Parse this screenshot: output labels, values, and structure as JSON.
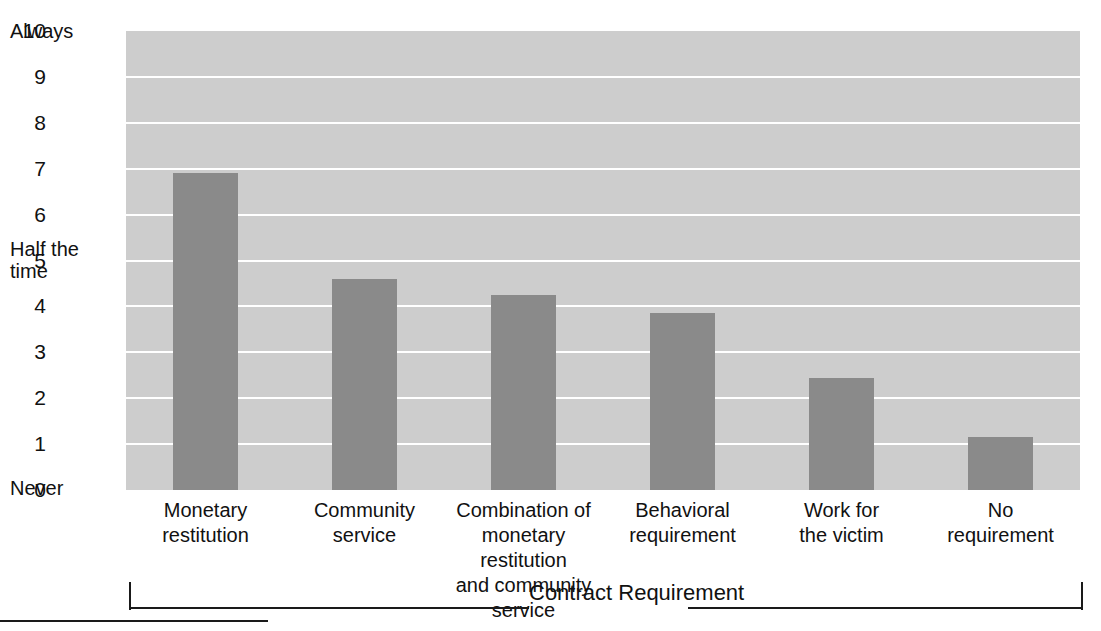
{
  "chart_data": {
    "type": "bar",
    "title": "",
    "subtitle": "",
    "xlabel": "Contract Requirement",
    "ylabel": "",
    "ylim": [
      0,
      10
    ],
    "grid": true,
    "legend": "none",
    "categories": [
      "Monetary\nrestitution",
      "Community\nservice",
      "Combination of\nmonetary restitution\nand community service",
      "Behavioral\nrequirement",
      "Work for\nthe victim",
      "No\nrequirement"
    ],
    "values": [
      6.9,
      4.6,
      4.25,
      3.85,
      2.45,
      1.15
    ],
    "ytick_labels": [
      "10",
      "9",
      "8",
      "7",
      "6",
      "5",
      "4",
      "3",
      "2",
      "1",
      "0"
    ],
    "ytick_values": [
      10,
      9,
      8,
      7,
      6,
      5,
      4,
      3,
      2,
      1,
      0
    ],
    "y_anchor_labels": [
      {
        "text": "Always",
        "value": 10
      },
      {
        "text": "Half the\ntime",
        "value": 5
      },
      {
        "text": "Never",
        "value": 0
      }
    ],
    "colors": {
      "bar": "#8a8a8a",
      "plot_background": "#cdcdcd",
      "gridline": "#ffffff",
      "text": "#111111",
      "axis_rule": "#1a1a1a",
      "page_background": "#ffffff"
    }
  },
  "y_axis": {
    "always_label": "Always",
    "half_label": "Half the\ntime",
    "never_label": "Never",
    "tick_10": "10",
    "tick_9": "9",
    "tick_8": "8",
    "tick_7": "7",
    "tick_6": "6",
    "tick_5": "5",
    "tick_4": "4",
    "tick_3": "3",
    "tick_2": "2",
    "tick_1": "1",
    "tick_0": "0"
  },
  "x_axis": {
    "title": "Contract Requirement",
    "cat_1": "Monetary\nrestitution",
    "cat_2": "Community\nservice",
    "cat_3": "Combination of\nmonetary restitution\nand community service",
    "cat_4": "Behavioral\nrequirement",
    "cat_5": "Work for\nthe victim",
    "cat_6": "No\nrequirement"
  }
}
